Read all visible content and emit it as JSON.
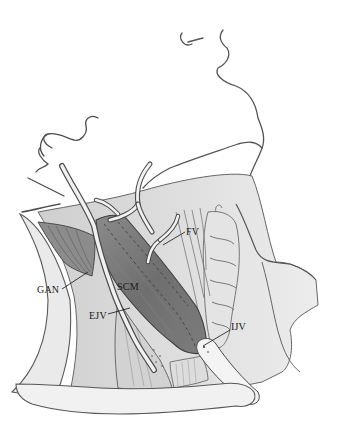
{
  "figure": {
    "style": "grayscale pencil/ink anatomical drawing",
    "colors": {
      "background": "#ffffff",
      "outline": "#4a4a4a",
      "muscle_dark": "#6e6e6e",
      "muscle_mid": "#9a9a9a",
      "soft_tissue": "#d6d6d6",
      "light_fill": "#ececec",
      "label_text": "#1a1a1a"
    }
  },
  "labels": [
    {
      "id": "fv",
      "text": "FV",
      "x": 186,
      "y": 229
    },
    {
      "id": "gan",
      "text": "GAN",
      "x": 37,
      "y": 287
    },
    {
      "id": "scm",
      "text": "SCM",
      "x": 118,
      "y": 284
    },
    {
      "id": "ejv",
      "text": "EJV",
      "x": 89,
      "y": 313
    },
    {
      "id": "ijv",
      "text": "IJV",
      "x": 231,
      "y": 324
    }
  ]
}
